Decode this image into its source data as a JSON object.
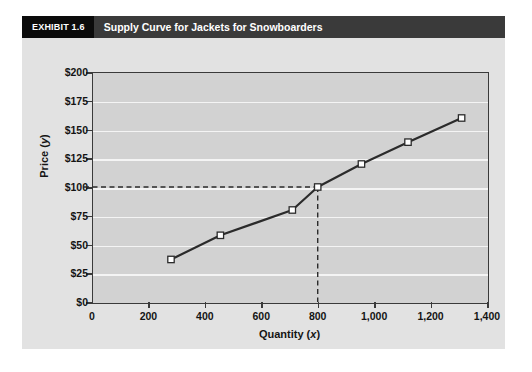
{
  "exhibit": {
    "number_label": "EXHIBIT 1.6",
    "title": "Supply Curve for Jackets for Snowboarders"
  },
  "chart_data": {
    "type": "line",
    "title": "Supply Curve for Jackets for Snowboarders",
    "xlabel": "Quantity (x)",
    "ylabel": "Price (y)",
    "xlim": [
      0,
      1400
    ],
    "ylim": [
      0,
      200
    ],
    "grid": true,
    "legend": "none",
    "x_tick_labels": [
      "0",
      "200",
      "400",
      "600",
      "800",
      "1,000",
      "1,200",
      "1,400"
    ],
    "x_tick_values": [
      0,
      200,
      400,
      600,
      800,
      1000,
      1200,
      1400
    ],
    "y_tick_labels": [
      "$0",
      "$25",
      "$50",
      "$75",
      "$100",
      "$125",
      "$150",
      "$175",
      "$200"
    ],
    "y_tick_values": [
      0,
      25,
      50,
      75,
      100,
      125,
      150,
      175,
      200
    ],
    "marker": "open-square",
    "line_color": "#2b2b2b",
    "marker_fill": "#ffffff",
    "plot_background": "#d2d2d2",
    "gridline_color": "#f4f4f4",
    "points": [
      {
        "x": 280,
        "y": 37
      },
      {
        "x": 455,
        "y": 58
      },
      {
        "x": 710,
        "y": 80
      },
      {
        "x": 800,
        "y": 100
      },
      {
        "x": 955,
        "y": 120
      },
      {
        "x": 1120,
        "y": 139
      },
      {
        "x": 1310,
        "y": 160
      }
    ],
    "annotations": [
      {
        "kind": "guide-line-horizontal",
        "value": 100,
        "style": "dashed",
        "from_x": 0,
        "to_x": 800
      },
      {
        "kind": "guide-line-vertical",
        "value": 800,
        "style": "dashed",
        "from_y": 0,
        "to_y": 100
      }
    ]
  }
}
